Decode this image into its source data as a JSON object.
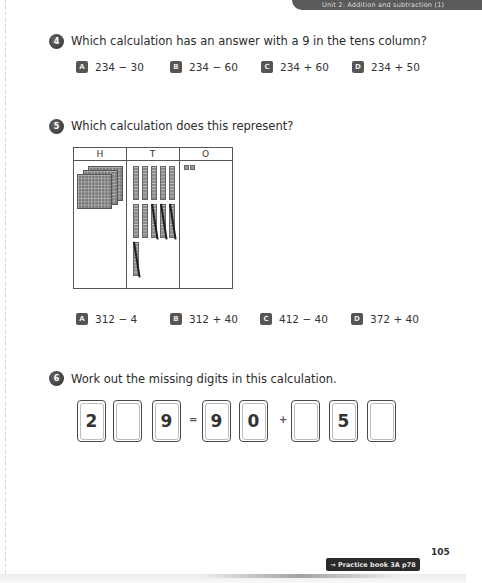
{
  "header": {
    "unit_title": "Unit 2: Addition and subtraction (1)"
  },
  "questions": [
    {
      "number": "4",
      "text": "Which calculation has an answer with a 9 in the tens column?",
      "options": [
        {
          "letter": "A",
          "text": "234 − 30"
        },
        {
          "letter": "B",
          "text": "234 − 60"
        },
        {
          "letter": "C",
          "text": "234 + 60"
        },
        {
          "letter": "D",
          "text": "234 + 50"
        }
      ]
    },
    {
      "number": "5",
      "text": "Which calculation does this represent?",
      "place_value_chart": {
        "headers": [
          "H",
          "T",
          "O"
        ],
        "hundreds_flats": 3,
        "tens_rods": 11,
        "tens_rods_crossed_out": 4,
        "ones_cubes": 2
      },
      "options": [
        {
          "letter": "A",
          "text": "312 − 4"
        },
        {
          "letter": "B",
          "text": "312 + 40"
        },
        {
          "letter": "C",
          "text": "412 − 40"
        },
        {
          "letter": "D",
          "text": "372 + 40"
        }
      ]
    },
    {
      "number": "6",
      "text": "Work out the missing digits in this calculation.",
      "boxes": [
        "2",
        "",
        "9",
        "9",
        "0",
        "",
        "5",
        ""
      ],
      "equals_sign": "=",
      "plus_sign": "+"
    }
  ],
  "footer": {
    "practice_link": "→ Practice book 3A p78",
    "page_number": "105"
  },
  "colors": {
    "badge": "#555555",
    "banner": "#5a5a5a",
    "text": "#2b2b2b"
  }
}
